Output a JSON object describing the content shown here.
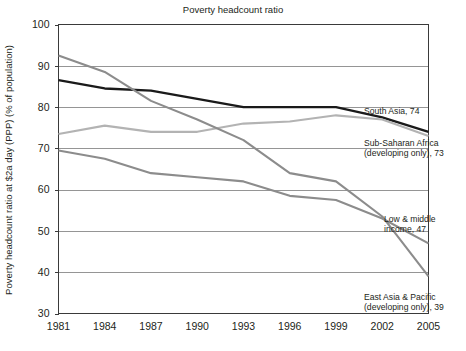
{
  "chart_data": {
    "type": "line",
    "title": "Poverty headcount ratio",
    "xlabel": "",
    "ylabel": "Poverty headcount ratio at $2a day (PPP) (% of population)",
    "x": [
      1981,
      1984,
      1987,
      1990,
      1993,
      1996,
      1999,
      2002,
      2005
    ],
    "xtick_labels": [
      "1981",
      "1984",
      "1987",
      "1990",
      "1993",
      "1996",
      "1999",
      "2002",
      "2005"
    ],
    "ytick_labels": [
      "30",
      "40",
      "50",
      "60",
      "70",
      "80",
      "90",
      "100"
    ],
    "yticks": [
      30,
      40,
      50,
      60,
      70,
      80,
      90,
      100
    ],
    "ylim": [
      30,
      100
    ],
    "xlim": [
      1981,
      2005
    ],
    "grid": true,
    "legend_position": "right-inline",
    "series": [
      {
        "name": "South Asia",
        "label": "South Asia, 74",
        "end_value": 74,
        "color": "#1a1a1a",
        "width": 2.3,
        "values": [
          86.5,
          84.5,
          84.0,
          82.0,
          80.0,
          80.0,
          80.0,
          77.5,
          74.0
        ]
      },
      {
        "name": "Sub-Saharan Africa (developing only)",
        "label_line1": "Sub-Saharan Africa",
        "label_line2": "(developing only), 73",
        "end_value": 73,
        "color": "#b3b3b3",
        "width": 2.1,
        "values": [
          73.5,
          75.5,
          74.0,
          74.0,
          76.0,
          76.5,
          78.0,
          77.0,
          73.0
        ]
      },
      {
        "name": "Low & middle income",
        "label_line1": "Low & middle",
        "label_line2": "income, 47",
        "end_value": 47,
        "color": "#8c8c8c",
        "width": 2.1,
        "values": [
          69.5,
          67.5,
          64.0,
          63.0,
          62.0,
          58.5,
          57.5,
          53.0,
          47.0
        ]
      },
      {
        "name": "East Asia & Pacific (developing only)",
        "label_line1": "East Asia & Pacific",
        "label_line2": "(developing only), 39",
        "end_value": 39,
        "color": "#8c8c8c",
        "width": 2.1,
        "values": [
          92.5,
          88.5,
          81.5,
          77.0,
          72.0,
          64.0,
          62.0,
          53.5,
          39.0
        ]
      }
    ],
    "annotations": [
      {
        "id": "south-asia",
        "text": "South Asia, 74"
      },
      {
        "id": "sub-saharan",
        "line1": "Sub-Saharan Africa",
        "line2": "(developing only), 73"
      },
      {
        "id": "low-middle",
        "line1": "Low & middle",
        "line2": "income, 47"
      },
      {
        "id": "east-asia",
        "line1": "East Asia & Pacific",
        "line2": "(developing only), 39"
      }
    ]
  }
}
